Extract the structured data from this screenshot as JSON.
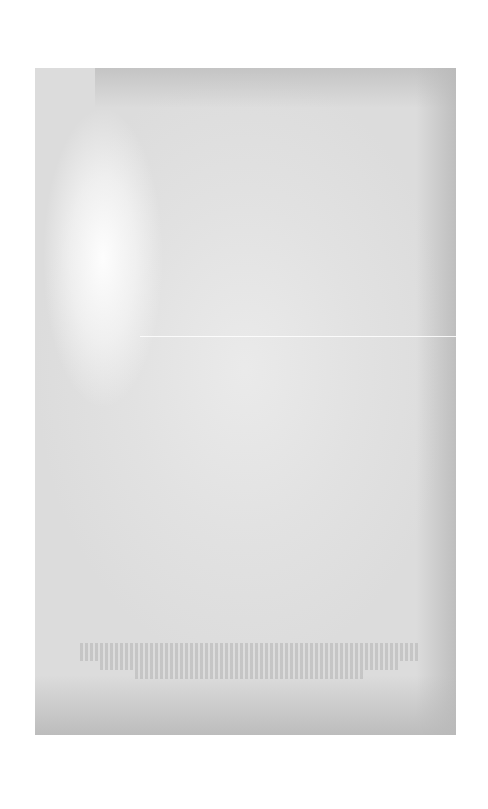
{
  "document": {
    "type": "scanned-page",
    "content_state": "blank page with faint bleed-through",
    "colors": {
      "background": "#ffffff",
      "paper": "#dcdcdc",
      "paper_edge": "#b9b9b9",
      "bright_patch": "#ffffff"
    },
    "bleed_through_text": {
      "legible": false,
      "line_count": 4,
      "line_widths_px": [
        340,
        340,
        300,
        230
      ]
    }
  }
}
